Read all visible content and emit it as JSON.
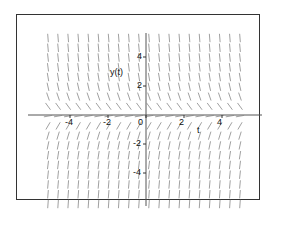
{
  "chart_data": {
    "type": "direction-field",
    "title": "",
    "xlabel": "t",
    "ylabel": "y(t)",
    "equation_behavior": "slopes proportional to -y: steep downward above t-axis, steep upward below t-axis, horizontal near y=0",
    "xlim": [
      -5,
      5
    ],
    "ylim": [
      -6,
      6
    ],
    "x_ticks": [
      -4,
      -2,
      0,
      2,
      4
    ],
    "y_ticks": [
      -4,
      -2,
      2,
      4
    ],
    "x_tick_labels": [
      "-4",
      "-2",
      "0",
      "2",
      "4"
    ],
    "y_tick_labels": [
      "-4",
      "-2",
      "2",
      "4"
    ],
    "grid": false,
    "legend": null,
    "field_grid": {
      "columns": 20,
      "rows": 18
    },
    "segment_color": "#888888",
    "axis_color": "#555555"
  },
  "labels": {
    "x_axis": "t",
    "y_axis": "y(t)"
  }
}
